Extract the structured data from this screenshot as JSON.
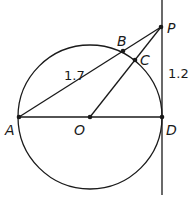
{
  "diagram": {
    "type": "geometry-circle-tangent-secant",
    "colors": {
      "stroke": "#1a1a1a",
      "background": "#ffffff"
    },
    "points": {
      "A": {
        "label": "A",
        "x": 19,
        "y": 117
      },
      "O": {
        "label": "O",
        "x": 90,
        "y": 117
      },
      "D": {
        "label": "D",
        "x": 162,
        "y": 117
      },
      "B": {
        "label": "B",
        "x": 123,
        "y": 51
      },
      "C": {
        "label": "C",
        "x": 135,
        "y": 60
      },
      "P": {
        "label": "P",
        "x": 161,
        "y": 27
      }
    },
    "circle": {
      "center": "O",
      "radius": 72
    },
    "segments": [
      "A-D",
      "A-P",
      "O-P",
      "tangent line through P and D"
    ],
    "measurements": {
      "AB": "1.7",
      "PD": "1.2"
    }
  }
}
